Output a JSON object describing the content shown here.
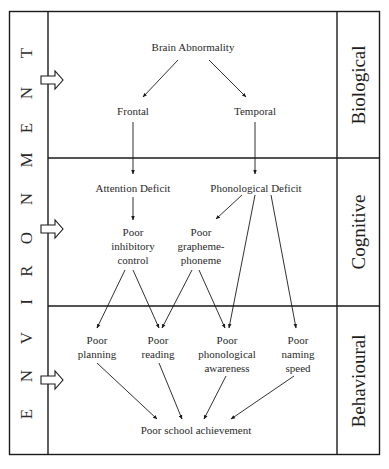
{
  "environment": {
    "label": "ENVIRONMENT",
    "letters": [
      {
        "ch": "E",
        "y": 414
      },
      {
        "ch": "N",
        "y": 376
      },
      {
        "ch": "V",
        "y": 338
      },
      {
        "ch": "I",
        "y": 302
      },
      {
        "ch": "R",
        "y": 271
      },
      {
        "ch": "O",
        "y": 238
      },
      {
        "ch": "N",
        "y": 199
      },
      {
        "ch": "M",
        "y": 160
      },
      {
        "ch": "E",
        "y": 128
      },
      {
        "ch": "N",
        "y": 93
      },
      {
        "ch": "T",
        "y": 53
      }
    ]
  },
  "levels": {
    "biological": "Biological",
    "cognitive": "Cognitive",
    "behavioural": "Behavioural"
  },
  "nodes": {
    "brain_abnormality": "Brain Abnormality",
    "frontal": "Frontal",
    "temporal": "Temporal",
    "attention_deficit": "Attention Deficit",
    "phonological_deficit": "Phonological Deficit",
    "poor_inhibitory_control": "Poor\ninhibitory\ncontrol",
    "poor_grapheme_phoneme": "Poor\ngrapheme-\nphoneme",
    "poor_planning": "Poor\nplanning",
    "poor_reading": "Poor\nreading",
    "poor_phonological_awareness": "Poor\nphonological\nawareness",
    "poor_naming_speed": "Poor\nnaming\nspeed",
    "poor_school_achievement": "Poor school achievement"
  },
  "colors": {
    "line": "#1a1a1a",
    "text": "#2a2a2a",
    "background": "#ffffff"
  }
}
